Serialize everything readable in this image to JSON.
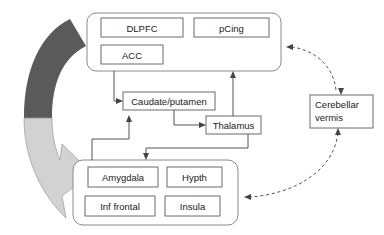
{
  "figure": {
    "background_color": "#ffffff",
    "stroke_color": "#555555"
  },
  "groups": [
    {
      "id": "cortical-group",
      "name": "cortical-regions-group",
      "nodes": [
        {
          "id": "dlpfc",
          "label": "DLPFC"
        },
        {
          "id": "pcing",
          "label": "pCing"
        },
        {
          "id": "acc",
          "label": "ACC"
        }
      ]
    },
    {
      "id": "limbic-group",
      "name": "limbic-regions-group",
      "nodes": [
        {
          "id": "amygdala",
          "label": "Amygdala"
        },
        {
          "id": "hypth",
          "label": "Hypth"
        },
        {
          "id": "inf-frontal",
          "label": "Inf frontal"
        },
        {
          "id": "insula",
          "label": "Insula"
        }
      ]
    }
  ],
  "nodes": [
    {
      "id": "caudate",
      "label": "Caudate/putamen"
    },
    {
      "id": "thalamus",
      "label": "Thalamus"
    }
  ],
  "cerebellar": {
    "id": "cerebellar-vermis",
    "line1": "Cerebellar",
    "line2": "vermis"
  },
  "arrows": {
    "curved_band": {
      "name": "curved-feedback-arrow",
      "dark_color": "#5a5a5a",
      "light_color": "#d2d2d2"
    },
    "solid_connections": [
      {
        "from": "cortical-group",
        "to": "caudate"
      },
      {
        "from": "caudate",
        "to": "thalamus"
      },
      {
        "from": "thalamus",
        "to": "cortical-group"
      },
      {
        "from": "thalamus",
        "to": "limbic-group"
      },
      {
        "from": "limbic-group",
        "to": "caudate"
      }
    ],
    "dashed_connections": [
      {
        "from": "cerebellar-vermis",
        "to": "cortical-group"
      },
      {
        "from": "cortical-group",
        "to": "cerebellar-vermis"
      },
      {
        "from": "cerebellar-vermis",
        "to": "limbic-group"
      },
      {
        "from": "limbic-group",
        "to": "cerebellar-vermis"
      }
    ]
  }
}
